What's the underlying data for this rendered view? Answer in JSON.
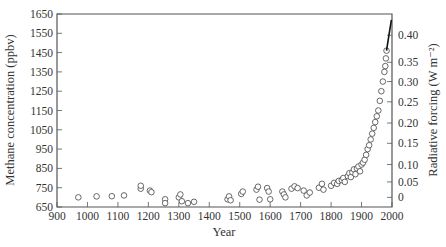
{
  "chart_data": {
    "type": "scatter",
    "title": "",
    "xlabel": "Year",
    "ylabel": "Methane concentration (ppbv)",
    "y2label": "Radiative forcing (W m⁻²)",
    "xlim": [
      900,
      2000
    ],
    "ylim": [
      650,
      1650
    ],
    "x_ticks": [
      900,
      1000,
      1100,
      1200,
      1300,
      1400,
      1500,
      1600,
      1700,
      1800,
      1900,
      2000
    ],
    "y_ticks": [
      650,
      750,
      850,
      950,
      1050,
      1150,
      1250,
      1350,
      1450,
      1550,
      1650
    ],
    "y2_ticks": [
      {
        "label": "0",
        "ppbv": 700
      },
      {
        "label": "0.05",
        "ppbv": 780
      },
      {
        "label": "0.10",
        "ppbv": 870
      },
      {
        "label": "0.15",
        "ppbv": 980
      },
      {
        "label": "0.20",
        "ppbv": 1085
      },
      {
        "label": "0.25",
        "ppbv": 1195
      },
      {
        "label": "0.30",
        "ppbv": 1300
      },
      {
        "label": "0.35",
        "ppbv": 1400
      },
      {
        "label": "0.40",
        "ppbv": 1540
      }
    ],
    "grid": false,
    "legend": null,
    "series": [
      {
        "name": "Ice core methane",
        "marker": "open-circle",
        "points": [
          [
            970,
            700
          ],
          [
            1030,
            705
          ],
          [
            1080,
            706
          ],
          [
            1120,
            710
          ],
          [
            1175,
            745
          ],
          [
            1175,
            760
          ],
          [
            1205,
            735
          ],
          [
            1210,
            727
          ],
          [
            1255,
            690
          ],
          [
            1255,
            670
          ],
          [
            1300,
            700
          ],
          [
            1305,
            715
          ],
          [
            1310,
            680
          ],
          [
            1330,
            670
          ],
          [
            1350,
            677
          ],
          [
            1460,
            690
          ],
          [
            1465,
            705
          ],
          [
            1470,
            685
          ],
          [
            1505,
            718
          ],
          [
            1510,
            730
          ],
          [
            1555,
            740
          ],
          [
            1560,
            755
          ],
          [
            1565,
            688
          ],
          [
            1590,
            748
          ],
          [
            1595,
            730
          ],
          [
            1600,
            690
          ],
          [
            1640,
            730
          ],
          [
            1645,
            715
          ],
          [
            1650,
            700
          ],
          [
            1670,
            745
          ],
          [
            1680,
            757
          ],
          [
            1690,
            748
          ],
          [
            1710,
            735
          ],
          [
            1720,
            710
          ],
          [
            1730,
            725
          ],
          [
            1760,
            750
          ],
          [
            1770,
            770
          ],
          [
            1775,
            740
          ],
          [
            1800,
            760
          ],
          [
            1810,
            775
          ],
          [
            1820,
            770
          ],
          [
            1825,
            785
          ],
          [
            1835,
            790
          ],
          [
            1840,
            800
          ],
          [
            1845,
            780
          ],
          [
            1855,
            810
          ],
          [
            1860,
            825
          ],
          [
            1865,
            805
          ],
          [
            1870,
            830
          ],
          [
            1875,
            845
          ],
          [
            1880,
            820
          ],
          [
            1885,
            850
          ],
          [
            1890,
            860
          ],
          [
            1895,
            835
          ],
          [
            1900,
            870
          ],
          [
            1905,
            880
          ],
          [
            1910,
            895
          ],
          [
            1915,
            920
          ],
          [
            1920,
            950
          ],
          [
            1925,
            970
          ],
          [
            1930,
            1000
          ],
          [
            1935,
            1030
          ],
          [
            1940,
            1060
          ],
          [
            1945,
            1090
          ],
          [
            1950,
            1120
          ],
          [
            1955,
            1150
          ],
          [
            1960,
            1200
          ],
          [
            1965,
            1250
          ],
          [
            1970,
            1300
          ],
          [
            1975,
            1350
          ],
          [
            1978,
            1380
          ],
          [
            1980,
            1420
          ],
          [
            1982,
            1460
          ]
        ]
      },
      {
        "name": "Atmospheric measurements",
        "marker": "line",
        "points": [
          [
            1982,
            1460
          ],
          [
            1990,
            1540
          ],
          [
            1998,
            1620
          ]
        ]
      }
    ]
  }
}
